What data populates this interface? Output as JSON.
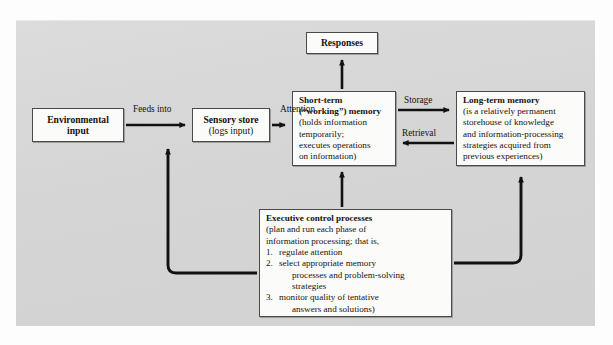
{
  "figure": {
    "type": "information-processing-model-flowchart",
    "panel_color": "#d6d6d6",
    "box_fill": "#fbfbfa",
    "line_color": "#111111"
  },
  "nodes": {
    "environmental_input": {
      "id": "environmental-input",
      "lines": [
        "Environmental",
        "input"
      ]
    },
    "sensory_store": {
      "id": "sensory-store",
      "title": "Sensory store",
      "lines": [
        "(logs input)"
      ]
    },
    "responses": {
      "id": "responses",
      "title": "Responses"
    },
    "short_term_memory": {
      "id": "short-term-memory",
      "title_line1": "Short-term",
      "title_line2": "(“working”) memory",
      "lines": [
        "(holds information",
        "temporarily;",
        "executes operations",
        "on information)"
      ]
    },
    "long_term_memory": {
      "id": "long-term-memory",
      "title": "Long-term memory",
      "lines": [
        "(is a relatively permanent",
        "storehouse of knowledge",
        "and information-processing",
        "strategies acquired from",
        "previous experiences)"
      ]
    },
    "executive_control": {
      "id": "executive-control-processes",
      "title": "Executive control processes",
      "lines": [
        "(plan and run each phase of",
        "information processing; that is,"
      ],
      "items": [
        {
          "num": "1.",
          "text": "regulate attention",
          "cont": []
        },
        {
          "num": "2.",
          "text": "select appropriate memory",
          "cont": [
            "processes and problem-solving",
            "strategies"
          ]
        },
        {
          "num": "3.",
          "text": "monitor quality of tentative",
          "cont": [
            "answers and solutions)"
          ]
        }
      ]
    }
  },
  "edge_labels": {
    "feeds_into": "Feeds into",
    "attention": "Attention",
    "storage": "Storage",
    "retrieval": "Retrieval"
  },
  "edges": [
    {
      "name": "environmental-input-to-sensory-store",
      "label": "Feeds into",
      "from": "environmental_input",
      "to": "sensory_store",
      "direction": "right"
    },
    {
      "name": "sensory-store-to-short-term-memory",
      "label": "Attention",
      "from": "sensory_store",
      "to": "short_term_memory",
      "direction": "right"
    },
    {
      "name": "short-term-memory-to-long-term-memory",
      "label": "Storage",
      "from": "short_term_memory",
      "to": "long_term_memory",
      "direction": "right"
    },
    {
      "name": "long-term-memory-to-short-term-memory",
      "label": "Retrieval",
      "from": "long_term_memory",
      "to": "short_term_memory",
      "direction": "left"
    },
    {
      "name": "short-term-memory-to-responses",
      "label": "",
      "from": "short_term_memory",
      "to": "responses",
      "direction": "up"
    },
    {
      "name": "executive-control-to-short-term-memory",
      "label": "",
      "from": "executive_control",
      "to": "short_term_memory",
      "direction": "up"
    },
    {
      "name": "executive-control-to-sensory-store",
      "label": "",
      "from": "executive_control",
      "to": "sensory_store",
      "direction": "left-up"
    },
    {
      "name": "executive-control-to-long-term-memory",
      "label": "",
      "from": "executive_control",
      "to": "long_term_memory",
      "direction": "right-up"
    }
  ]
}
